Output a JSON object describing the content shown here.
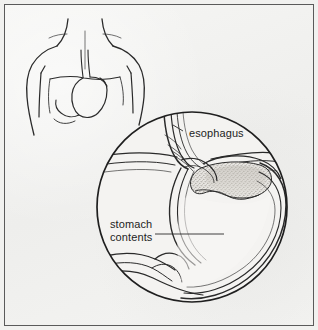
{
  "figure": {
    "kind": "medical-line-illustration",
    "background_color": "#f2f2f0",
    "ink_color": "#1d1d1d",
    "frame_color": "#5a5a5a",
    "width": 318,
    "height": 330
  },
  "labels": {
    "esophagus": "esophagus",
    "stomach_contents_line1": "stomach",
    "stomach_contents_line2": "contents"
  },
  "panels": {
    "torso": {
      "name": "torso-overview",
      "description": "outline of human head-less upper body with neck, shoulders, arms and internal stomach with esophagus"
    },
    "magnifier": {
      "name": "magnified-cross-section",
      "description": "circular inset showing esophagus entering stomach with stippled stomach contents",
      "center_x": 191,
      "center_y": 206,
      "radius": 96
    }
  },
  "leaders": {
    "esophagus_leader": "line from esophagus label to esophagus tube",
    "stomach_contents_leader": "line from stomach contents label into stomach lumen"
  }
}
